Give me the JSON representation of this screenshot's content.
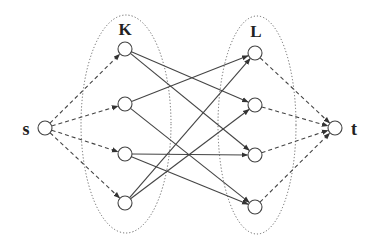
{
  "diagram": {
    "type": "flow-network",
    "colors": {
      "stroke": "#444444",
      "dotted": "#666666",
      "label": "#222222",
      "background": "#ffffff"
    },
    "labels": {
      "source": "s",
      "sink": "t",
      "set_k": "K",
      "set_l": "L"
    },
    "sets": [
      {
        "id": "K",
        "cx": 126,
        "cy": 124,
        "rx": 45,
        "ry": 109
      },
      {
        "id": "L",
        "cx": 257,
        "cy": 125,
        "rx": 39,
        "ry": 109
      }
    ],
    "nodes": [
      {
        "id": "s",
        "x": 45,
        "y": 128
      },
      {
        "id": "k1",
        "x": 125,
        "y": 49
      },
      {
        "id": "k2",
        "x": 125,
        "y": 104
      },
      {
        "id": "k3",
        "x": 125,
        "y": 154
      },
      {
        "id": "k4",
        "x": 125,
        "y": 203
      },
      {
        "id": "l1",
        "x": 255,
        "y": 53
      },
      {
        "id": "l2",
        "x": 255,
        "y": 105
      },
      {
        "id": "l3",
        "x": 255,
        "y": 155
      },
      {
        "id": "l4",
        "x": 255,
        "y": 207
      },
      {
        "id": "t",
        "x": 335,
        "y": 128
      }
    ],
    "edges": [
      {
        "from": "s",
        "to": "k1",
        "style": "dashed"
      },
      {
        "from": "s",
        "to": "k2",
        "style": "dashed"
      },
      {
        "from": "s",
        "to": "k3",
        "style": "dashed"
      },
      {
        "from": "s",
        "to": "k4",
        "style": "dashed"
      },
      {
        "from": "k1",
        "to": "l2",
        "style": "solid"
      },
      {
        "from": "k1",
        "to": "l3",
        "style": "solid"
      },
      {
        "from": "k2",
        "to": "l1",
        "style": "solid"
      },
      {
        "from": "k2",
        "to": "l4",
        "style": "solid"
      },
      {
        "from": "k3",
        "to": "l3",
        "style": "solid"
      },
      {
        "from": "k3",
        "to": "l4",
        "style": "solid"
      },
      {
        "from": "k4",
        "to": "l1",
        "style": "solid"
      },
      {
        "from": "k4",
        "to": "l2",
        "style": "solid"
      },
      {
        "from": "l1",
        "to": "t",
        "style": "dashed"
      },
      {
        "from": "l2",
        "to": "t",
        "style": "dashed"
      },
      {
        "from": "l3",
        "to": "t",
        "style": "dashed"
      },
      {
        "from": "l4",
        "to": "t",
        "style": "dashed"
      }
    ]
  }
}
